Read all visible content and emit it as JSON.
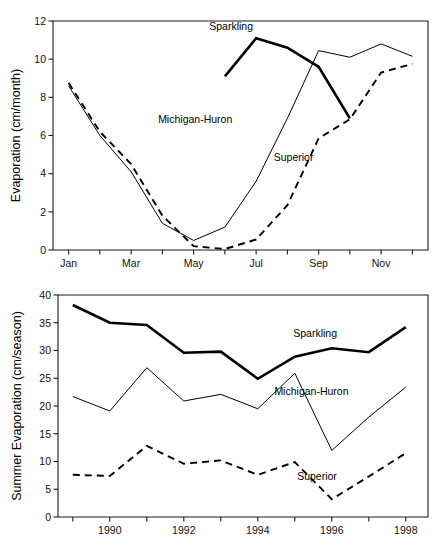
{
  "figure": {
    "background": "#ffffff",
    "line_color": "#000000",
    "axis_color": "#1a1a1a"
  },
  "chart_data": [
    {
      "id": "monthly-evaporation",
      "type": "line",
      "title": "",
      "xlabel": "",
      "ylabel": "Evaporation (cm/month)",
      "xlim": [
        0.5,
        12.5
      ],
      "ylim": [
        0,
        12
      ],
      "yticks": [
        0,
        2,
        4,
        6,
        8,
        10,
        12
      ],
      "yticklabels": [
        "0",
        "2",
        "4",
        "6",
        "8",
        "10",
        "12"
      ],
      "x": [
        1,
        2,
        3,
        4,
        5,
        6,
        7,
        8,
        9,
        10,
        11,
        12
      ],
      "xticks": [
        1,
        2,
        3,
        4,
        5,
        6,
        7,
        8,
        9,
        10,
        11,
        12
      ],
      "xticklabels": [
        "Jan",
        "",
        "Mar",
        "",
        "May",
        "",
        "Jul",
        "",
        "Sep",
        "",
        "Nov",
        ""
      ],
      "grid": false,
      "legend_position": "inline-annotations",
      "series": [
        {
          "name": "Sparkling",
          "style": "thick-solid",
          "x": [
            6,
            7,
            8,
            9,
            10
          ],
          "values": [
            9.1,
            11.1,
            10.6,
            9.6,
            6.9
          ]
        },
        {
          "name": "Michigan-Huron",
          "style": "thin-solid",
          "x": [
            1,
            2,
            3,
            4,
            5,
            6,
            7,
            8,
            9,
            10,
            11,
            12
          ],
          "values": [
            8.6,
            6.0,
            4.1,
            1.4,
            0.5,
            1.2,
            3.6,
            6.9,
            10.45,
            10.1,
            10.8,
            10.15
          ]
        },
        {
          "name": "Superior",
          "style": "dashed",
          "x": [
            1,
            2,
            3,
            4,
            5,
            6,
            7,
            8,
            9,
            10,
            11,
            12
          ],
          "values": [
            8.75,
            6.2,
            4.5,
            1.8,
            0.2,
            0.05,
            0.55,
            2.35,
            5.85,
            6.85,
            9.3,
            9.75
          ]
        }
      ],
      "annotations": [
        {
          "text": "Sparkling",
          "x": 6.2,
          "y": 11.75
        },
        {
          "text": "Michigan-Huron",
          "x": 5.05,
          "y": 6.85
        },
        {
          "text": "Superior",
          "x": 8.2,
          "y": 4.85
        }
      ]
    },
    {
      "id": "summer-evaporation",
      "type": "line",
      "title": "",
      "xlabel": "",
      "ylabel": "Summer Evaporation (cm/season)",
      "xlim": [
        1988.6,
        1998.6
      ],
      "ylim": [
        0,
        40
      ],
      "yticks": [
        0,
        5,
        10,
        15,
        20,
        25,
        30,
        35,
        40
      ],
      "yticklabels": [
        "0",
        "5",
        "10",
        "15",
        "20",
        "25",
        "30",
        "35",
        "40"
      ],
      "x": [
        1989,
        1990,
        1991,
        1992,
        1993,
        1994,
        1995,
        1996,
        1997,
        1998
      ],
      "xticks": [
        1989,
        1990,
        1991,
        1992,
        1993,
        1994,
        1995,
        1996,
        1997,
        1998
      ],
      "xticklabels": [
        "",
        "1990",
        "",
        "1992",
        "",
        "1994",
        "",
        "1996",
        "",
        "1998"
      ],
      "grid": false,
      "legend_position": "inline-annotations",
      "series": [
        {
          "name": "Sparkling",
          "style": "thick-solid",
          "x": [
            1989,
            1990,
            1991,
            1992,
            1993,
            1994,
            1995,
            1996,
            1997,
            1998
          ],
          "values": [
            38.2,
            35.0,
            34.6,
            29.6,
            29.8,
            24.9,
            28.9,
            30.4,
            29.7,
            34.2
          ]
        },
        {
          "name": "Michigan-Huron",
          "style": "thin-solid",
          "x": [
            1989,
            1990,
            1991,
            1992,
            1993,
            1994,
            1995,
            1996,
            1997,
            1998
          ],
          "values": [
            21.7,
            19.1,
            26.9,
            20.9,
            22.1,
            19.5,
            25.9,
            12.0,
            18.0,
            23.4
          ]
        },
        {
          "name": "Superior",
          "style": "dashed",
          "x": [
            1989,
            1990,
            1991,
            1992,
            1993,
            1994,
            1995,
            1996,
            1997,
            1998
          ],
          "values": [
            7.6,
            7.4,
            12.8,
            9.6,
            10.2,
            7.6,
            9.9,
            3.2,
            7.3,
            11.5
          ]
        }
      ],
      "annotations": [
        {
          "text": "Sparkling",
          "x": 1995.55,
          "y": 33.2
        },
        {
          "text": "Michigan-Huron",
          "x": 1995.45,
          "y": 22.6
        },
        {
          "text": "Superior",
          "x": 1995.6,
          "y": 7.3
        }
      ]
    }
  ]
}
